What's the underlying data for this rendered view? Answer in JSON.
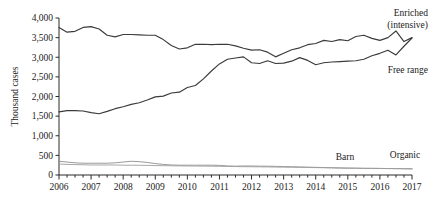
{
  "chart_data": {
    "type": "line",
    "title": "",
    "xlabel": "",
    "ylabel": "Thousand cases",
    "xlim": [
      2006.0,
      2017.0
    ],
    "ylim": [
      0,
      4000
    ],
    "grid": false,
    "legend_position": "inline-right-of-series",
    "xticks": [
      "2006",
      "2007",
      "2008",
      "2009",
      "2010",
      "2011",
      "2012",
      "2013",
      "2014",
      "2015",
      "2016",
      "2017"
    ],
    "yticks": [
      "0",
      "500",
      "1,000",
      "1,500",
      "2,000",
      "2,500",
      "3,000",
      "3,500",
      "4,000"
    ],
    "minor_ticks_per_year": 4,
    "x": [
      2006.0,
      2006.25,
      2006.5,
      2006.75,
      2007.0,
      2007.25,
      2007.5,
      2007.75,
      2008.0,
      2008.25,
      2008.5,
      2008.75,
      2009.0,
      2009.25,
      2009.5,
      2009.75,
      2010.0,
      2010.25,
      2010.5,
      2010.75,
      2011.0,
      2011.25,
      2011.5,
      2011.75,
      2012.0,
      2012.25,
      2012.5,
      2012.75,
      2013.0,
      2013.25,
      2013.5,
      2013.75,
      2014.0,
      2014.25,
      2014.5,
      2014.75,
      2015.0,
      2015.25,
      2015.5,
      2015.75,
      2016.0,
      2016.25,
      2016.5,
      2016.75,
      2017.0
    ],
    "series": [
      {
        "name": "Enriched (intensive)",
        "label": "Enriched\n(intensive)",
        "label_line1": "Enriched",
        "label_line2": "(intensive)",
        "color": "#3b3b3b",
        "values": [
          3760,
          3640,
          3660,
          3760,
          3780,
          3720,
          3560,
          3520,
          3580,
          3580,
          3570,
          3560,
          3560,
          3450,
          3300,
          3210,
          3240,
          3330,
          3330,
          3320,
          3330,
          3330,
          3290,
          3230,
          3180,
          3190,
          3130,
          3010,
          3100,
          3190,
          3240,
          3320,
          3350,
          3430,
          3400,
          3450,
          3420,
          3530,
          3560,
          3480,
          3430,
          3500,
          3670,
          3400,
          3500
        ]
      },
      {
        "name": "Free range",
        "label": "Free range",
        "color": "#3b3b3b",
        "values": [
          1610,
          1640,
          1640,
          1630,
          1590,
          1560,
          1620,
          1690,
          1740,
          1800,
          1840,
          1910,
          1990,
          2010,
          2090,
          2110,
          2230,
          2280,
          2450,
          2650,
          2830,
          2950,
          2980,
          3010,
          2860,
          2840,
          2910,
          2840,
          2850,
          2900,
          2990,
          2920,
          2810,
          2860,
          2880,
          2890,
          2900,
          2910,
          2950,
          3040,
          3100,
          3180,
          3060,
          3280,
          3490
        ]
      },
      {
        "name": "Barn",
        "label": "Barn",
        "color": "#8d8d8d",
        "values": [
          350,
          330,
          310,
          300,
          300,
          300,
          300,
          310,
          330,
          350,
          340,
          320,
          290,
          270,
          255,
          250,
          250,
          250,
          250,
          250,
          245,
          230,
          225,
          230,
          230,
          225,
          225,
          220,
          215,
          210,
          205,
          200,
          195,
          190,
          185,
          180,
          175,
          175,
          170,
          170,
          168,
          165,
          162,
          160,
          158
        ]
      },
      {
        "name": "Organic",
        "label": "Organic",
        "color": "#9d9d9d",
        "values": [
          280,
          270,
          265,
          260,
          255,
          255,
          255,
          255,
          250,
          250,
          248,
          245,
          240,
          238,
          235,
          232,
          230,
          228,
          226,
          224,
          222,
          218,
          215,
          212,
          210,
          208,
          205,
          202,
          200,
          197,
          195,
          192,
          188,
          185,
          182,
          178,
          175,
          172,
          170,
          168,
          166,
          164,
          162,
          160,
          155
        ]
      }
    ]
  },
  "labels": {
    "enriched_l1": "Enriched",
    "enriched_l2": "(intensive)",
    "free_range": "Free range",
    "barn": "Barn",
    "organic": "Organic",
    "y_axis_title": "Thousand cases"
  }
}
